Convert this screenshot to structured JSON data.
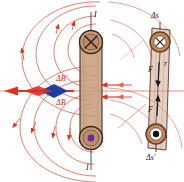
{
  "figure": {
    "type": "physics-diagram"
  },
  "colors": {
    "field_line": "#d4604a",
    "field_line_light": "#e08a78",
    "arrow_red": "#e03020",
    "arrow_blue": "#1f3f9e",
    "wire_fill": "#c79a7a",
    "wire_edge": "#5a3a26",
    "dot_purple": "#6b2d8e",
    "label_red": "#d12b1e",
    "label_dark": "#1a1a1a",
    "axis_red": "#e8695a"
  },
  "left_diagram": {
    "name": "two-parallel-wires-field-superposition",
    "top_wire": {
      "symbol": "cross",
      "meaning": "current into page",
      "current_label": "I"
    },
    "bottom_wire": {
      "symbol": "dot",
      "meaning": "current out of page",
      "current_label": "I"
    },
    "field_labels": [
      {
        "text": "ΔB′",
        "position": "upper"
      },
      {
        "text": "ΔB",
        "position": "lower"
      }
    ],
    "resultant_arrow": {
      "direction": "left",
      "colors": [
        "#e03020",
        "#1f3f9e"
      ],
      "description": "net field vector arrow pointing left"
    },
    "field_line_count": 8,
    "arrow_direction_top": "counterclockwise-right",
    "arrow_direction_bottom": "clockwise-left"
  },
  "right_diagram": {
    "name": "current-elements-force-pair",
    "top_element": {
      "symbol": "cross",
      "meaning": "current into page",
      "label": "Δs"
    },
    "bottom_element": {
      "symbol": "dot",
      "meaning": "current out of page",
      "label": "Δs′"
    },
    "forces": [
      {
        "text": "F",
        "direction": "down",
        "position": "upper"
      },
      {
        "text": "F",
        "direction": "up",
        "position": "lower"
      }
    ],
    "separation_label": "r"
  },
  "axis": {
    "horizontal_line": true,
    "color": "#e8695a"
  }
}
